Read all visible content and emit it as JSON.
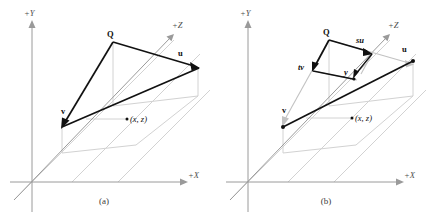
{
  "figure": {
    "colors": {
      "axis": "#9a9a9a",
      "grid": "#d2d2d2",
      "vector": "#111111",
      "ghost_vector": "#c2c2c2",
      "background": "#ffffff"
    },
    "panels": [
      {
        "id": "a",
        "caption": "(a)",
        "axes": {
          "y_label": "+Y",
          "x_label": "+X",
          "z_label": "+Z"
        },
        "labels": {
          "point_q": "Q",
          "vector_u": "u",
          "vector_v": "v",
          "coord_point": "(x, z)"
        }
      },
      {
        "id": "b",
        "caption": "(b)",
        "axes": {
          "y_label": "+Y",
          "x_label": "+X",
          "z_label": "+Z"
        },
        "labels": {
          "point_q": "Q",
          "vector_su": "su",
          "vector_tv": "tv",
          "point_y": "y",
          "vector_u": "u",
          "vector_v": "v",
          "coord_point": "(x, z)"
        }
      }
    ]
  }
}
